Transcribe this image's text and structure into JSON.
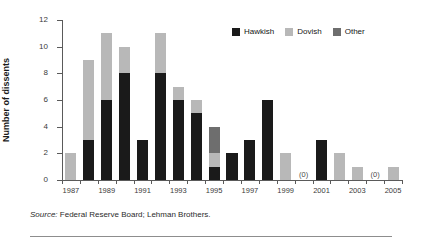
{
  "chart_data": {
    "type": "bar",
    "subtype": "stacked-vertical",
    "title": "",
    "xlabel": "",
    "ylabel": "Number of dissents",
    "ylim": [
      0,
      12
    ],
    "ytick_step": 2,
    "yticks": [
      0,
      2,
      4,
      6,
      8,
      10,
      12
    ],
    "grid": false,
    "legend_position": "top-right",
    "categories": [
      1987,
      1988,
      1989,
      1990,
      1991,
      1992,
      1993,
      1994,
      1995,
      1996,
      1997,
      1998,
      1999,
      2000,
      2001,
      2002,
      2003,
      2004,
      2005
    ],
    "xtick_labels": [
      "1987",
      "1989",
      "1991",
      "1993",
      "1995",
      "1997",
      "1999",
      "2001",
      "2003",
      "2005"
    ],
    "xtick_values": [
      1987,
      1989,
      1991,
      1993,
      1995,
      1997,
      1999,
      2001,
      2003,
      2005
    ],
    "series": [
      {
        "name": "Hawkish",
        "color": "#1a1a1a",
        "values": [
          0,
          3,
          6,
          8,
          3,
          8,
          6,
          5,
          1,
          2,
          3,
          6,
          0,
          0,
          3,
          0,
          0,
          0,
          0
        ]
      },
      {
        "name": "Dovish",
        "color": "#b8b8b8",
        "values": [
          2,
          6,
          5,
          2,
          0,
          3,
          1,
          1,
          1,
          0,
          0,
          0,
          2,
          0,
          0,
          2,
          1,
          0,
          1
        ]
      },
      {
        "name": "Other",
        "color": "#6e6e6e",
        "values": [
          0,
          0,
          0,
          0,
          0,
          0,
          0,
          0,
          2,
          0,
          0,
          0,
          0,
          0,
          0,
          0,
          0,
          0,
          0
        ]
      }
    ],
    "totals": [
      2,
      9,
      11,
      10,
      3,
      11,
      7,
      6,
      4,
      2,
      3,
      6,
      2,
      0,
      3,
      2,
      1,
      0,
      1
    ],
    "annotations": [
      {
        "x": 2000,
        "text": "(0)"
      },
      {
        "x": 2004,
        "text": "(0)"
      }
    ]
  },
  "legend": {
    "items": [
      {
        "label": "Hawkish",
        "color": "#1a1a1a"
      },
      {
        "label": "Dovish",
        "color": "#b8b8b8"
      },
      {
        "label": "Other",
        "color": "#6e6e6e"
      }
    ]
  },
  "source": {
    "prefix": "Source:",
    "text": " Federal Reserve Board; Lehman Brothers."
  }
}
